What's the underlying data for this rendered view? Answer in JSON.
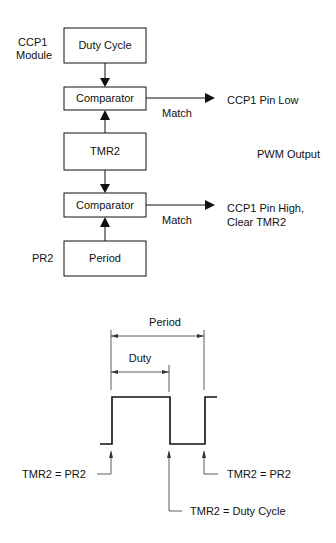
{
  "block_diagram": {
    "module_label_line1": "CCP1",
    "module_label_line2": "Module",
    "duty_cycle_box": "Duty Cycle",
    "comparator1_box": "Comparator",
    "match1_label": "Match",
    "output1_label": "CCP1 Pin Low",
    "tmr2_box": "TMR2",
    "pwm_output_label": "PWM Output",
    "comparator2_box": "Comparator",
    "match2_label": "Match",
    "output2_line1": "CCP1 Pin High,",
    "output2_line2": "Clear TMR2",
    "pr2_label": "PR2",
    "period_box": "Period"
  },
  "waveform": {
    "period_label": "Period",
    "duty_label": "Duty",
    "left_event": "TMR2 = PR2",
    "right_event": "TMR2 = PR2",
    "duty_event": "TMR2 = Duty Cycle"
  }
}
